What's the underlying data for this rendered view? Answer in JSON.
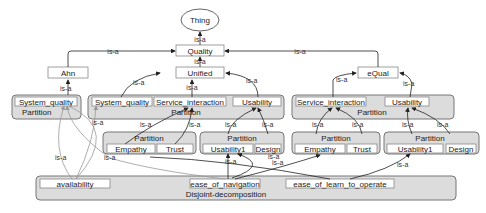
{
  "diagram": {
    "root": {
      "label": "Thing"
    },
    "nodes": {
      "quality": "Quality",
      "ahn": "Ahn",
      "unified": "Unified",
      "equal": "eQual"
    },
    "edge_label": "is-a",
    "groups": {
      "ahn_partition": {
        "label": "Partition",
        "items": [
          "System_quality"
        ]
      },
      "unified_partition": {
        "label": "Partition",
        "items": [
          "System_quality",
          "Service_interaction",
          "Usability"
        ]
      },
      "unified_si_partition": {
        "label": "Partition",
        "items": [
          "Empathy",
          "Trust"
        ]
      },
      "unified_us_partition": {
        "label": "Partition",
        "items": [
          "Usability1",
          "Design"
        ]
      },
      "equal_partition": {
        "label": "Partition",
        "items": [
          "Service_interaction",
          "Usability"
        ]
      },
      "equal_si_partition": {
        "label": "Partition",
        "items": [
          "Empathy",
          "Trust"
        ]
      },
      "equal_us_partition": {
        "label": "Partition",
        "items": [
          "Usability1",
          "Design"
        ]
      },
      "disjoint": {
        "label": "Disjoint-decomposition",
        "items": [
          "availability",
          "ease_of_navigation",
          "ease_of_learn_to_operate"
        ]
      }
    }
  }
}
